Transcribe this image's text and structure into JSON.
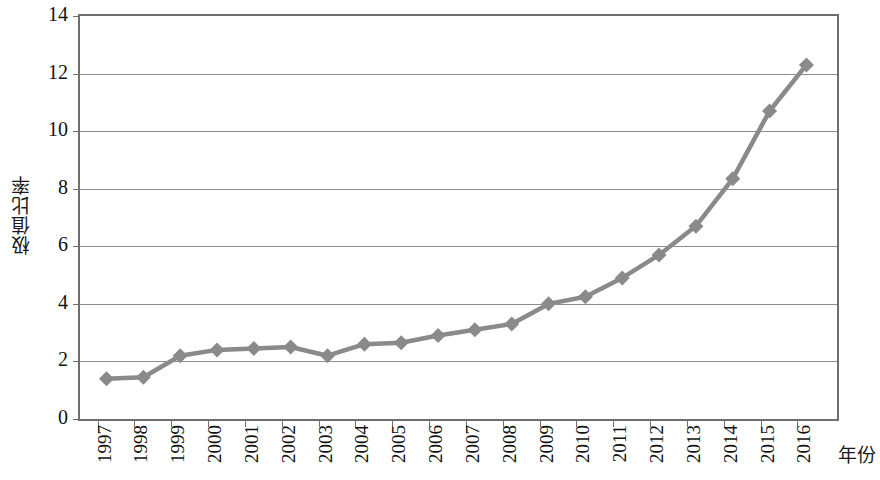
{
  "chart_data": {
    "type": "line",
    "title": "",
    "xlabel": "年份",
    "ylabel": "极值比率",
    "categories": [
      "1997",
      "1998",
      "1999",
      "2000",
      "2001",
      "2002",
      "2003",
      "2004",
      "2005",
      "2006",
      "2007",
      "2008",
      "2009",
      "2010",
      "2011",
      "2012",
      "2013",
      "2014",
      "2015",
      "2016"
    ],
    "values": [
      1.4,
      1.45,
      2.2,
      2.4,
      2.45,
      2.5,
      2.2,
      2.6,
      2.65,
      2.9,
      3.1,
      3.3,
      4.0,
      4.25,
      4.9,
      5.7,
      6.7,
      8.35,
      10.7,
      12.3
    ],
    "ylim": [
      0,
      14
    ],
    "ytick_labels": [
      "0",
      "2",
      "4",
      "6",
      "8",
      "10",
      "12",
      "14"
    ],
    "ytick_values": [
      0,
      2,
      4,
      6,
      8,
      10,
      12,
      14
    ],
    "grid": true,
    "legend": "none",
    "series_color": "#8a8a8a",
    "marker": "diamond",
    "axis_color": "#6f6f6f",
    "background": "#ffffff"
  }
}
